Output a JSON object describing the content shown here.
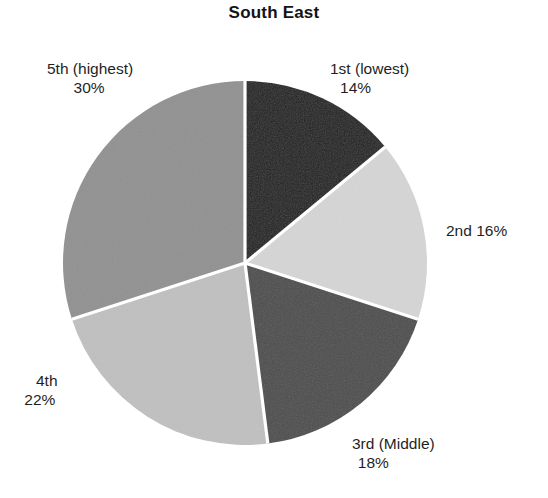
{
  "chart_data": {
    "type": "pie",
    "title": "South East",
    "xlabel": "",
    "ylabel": "",
    "legend_position": "none",
    "grid": false,
    "start_angle_deg": 0,
    "direction": "clockwise",
    "units": "percent",
    "total": 100,
    "categories": [
      "1st (lowest)",
      "2nd",
      "3rd (Middle)",
      "4th",
      "5th (highest)"
    ],
    "values": [
      14,
      16,
      18,
      22,
      30
    ],
    "slices": [
      {
        "name": "1st (lowest)",
        "value": 14,
        "value_label": "14%",
        "color": "#1f1f1f",
        "label_position": "outside-top-right",
        "label_layout": "stacked"
      },
      {
        "name": "2nd",
        "value": 16,
        "value_label": "16%",
        "color": "#d5d5d5",
        "label_position": "outside-right",
        "label_layout": "inline"
      },
      {
        "name": "3rd (Middle)",
        "value": 18,
        "value_label": "18%",
        "color": "#4d4d4d",
        "label_position": "outside-bottom-right",
        "label_layout": "stacked"
      },
      {
        "name": "4th",
        "value": 22,
        "value_label": "22%",
        "color": "#c0c0c0",
        "label_position": "outside-bottom-left",
        "label_layout": "stacked"
      },
      {
        "name": "5th (highest)",
        "value": 30,
        "value_label": "30%",
        "color": "#919191",
        "label_position": "outside-top-left",
        "label_layout": "stacked"
      }
    ],
    "separator_color": "#ffffff",
    "background_color": "#ffffff",
    "text_color": "#1f1f1f"
  }
}
